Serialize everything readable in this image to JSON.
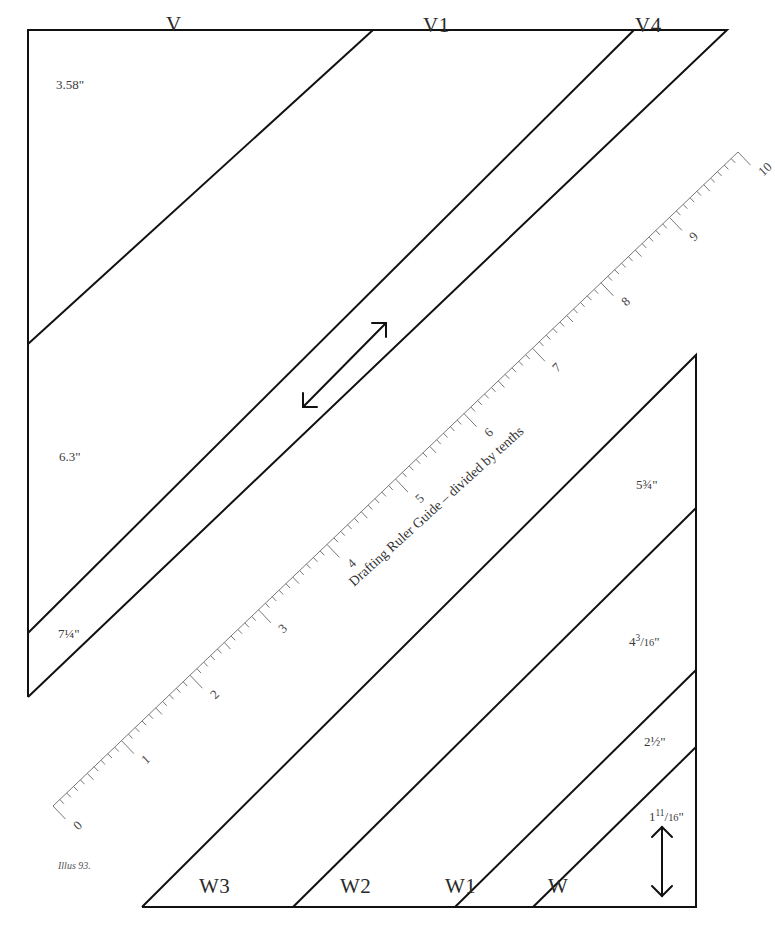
{
  "diagram": {
    "type": "drafting template",
    "caption": "Illus 93.",
    "colors": {
      "line": "#111111",
      "ruler": "#777777",
      "text": "#2a2a2a",
      "background": "#ffffff"
    },
    "top_block": {
      "regions": [
        {
          "id": "V",
          "label": "V"
        },
        {
          "id": "V1",
          "label": "V1"
        },
        {
          "id": "V4",
          "label": "V4"
        }
      ],
      "measurements": [
        {
          "id": "m_v",
          "text": "3.58\""
        },
        {
          "id": "m_v1",
          "text": "6.3\""
        },
        {
          "id": "m_v4",
          "text": "7¼\""
        }
      ]
    },
    "bottom_block": {
      "regions": [
        {
          "id": "W3",
          "label": "W3"
        },
        {
          "id": "W2",
          "label": "W2"
        },
        {
          "id": "W1",
          "label": "W1"
        },
        {
          "id": "W",
          "label": "W"
        }
      ],
      "measurements": [
        {
          "id": "m_w2",
          "whole": "5",
          "frac": "¾",
          "unit": "\""
        },
        {
          "id": "m_w1",
          "whole": "4",
          "num": "3",
          "den": "16",
          "unit": "\""
        },
        {
          "id": "m_w0",
          "whole": "2",
          "frac": "½",
          "unit": "\""
        },
        {
          "id": "m_w",
          "whole": "1",
          "num": "11",
          "den": "16",
          "unit": "\""
        }
      ]
    },
    "ruler": {
      "title": "Drafting Ruler Guide – divided by tenths",
      "major_ticks": [
        "0",
        "1",
        "2",
        "3",
        "4",
        "5",
        "6",
        "7",
        "8",
        "9",
        "10"
      ],
      "minor_divisions": 10
    },
    "arrows": [
      {
        "id": "diagonal-arrow",
        "direction": "bidirectional diagonal"
      },
      {
        "id": "vertical-arrow",
        "direction": "bidirectional vertical"
      }
    ]
  }
}
